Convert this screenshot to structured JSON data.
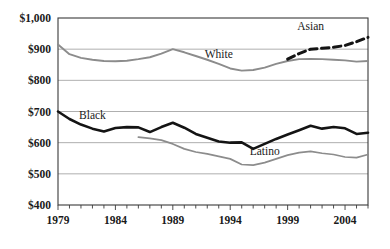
{
  "chart_data": {
    "type": "line",
    "title": "",
    "subtitle": "",
    "xlabel": "",
    "ylabel": "",
    "xlim": [
      1979,
      2006
    ],
    "ylim": [
      400,
      1000
    ],
    "ytick_labels": [
      "$1,000",
      "$900",
      "$800",
      "$700",
      "$600",
      "$500",
      "$400"
    ],
    "ytick_values": [
      1000,
      900,
      800,
      700,
      600,
      500,
      400
    ],
    "xtick_labels": [
      "1979",
      "1984",
      "1989",
      "1994",
      "1999",
      "2004"
    ],
    "xtick_values": [
      1979,
      1984,
      1989,
      1994,
      1999,
      2004
    ],
    "x_minor_tick_interval": 1,
    "grid": "horizontal",
    "legend": "inline-annotations",
    "annotations": [
      {
        "name": "white-label",
        "text": "White",
        "x": 1993.0,
        "y": 872
      },
      {
        "name": "asian-label",
        "text": "Asian",
        "x": 2001.0,
        "y": 962
      },
      {
        "name": "black-label",
        "text": "Black",
        "x": 1982.0,
        "y": 676
      },
      {
        "name": "latino-label",
        "text": "Latino",
        "x": 1997.0,
        "y": 560
      }
    ],
    "series": [
      {
        "name": "White",
        "style": "solid",
        "color": "#8c8c8c",
        "width": 1.9,
        "x": [
          1979,
          1980,
          1981,
          1982,
          1983,
          1984,
          1985,
          1986,
          1987,
          1988,
          1989,
          1990,
          1991,
          1992,
          1993,
          1994,
          1995,
          1996,
          1997,
          1998,
          1999,
          2000,
          2001,
          2002,
          2003,
          2004,
          2005,
          2006
        ],
        "values": [
          915,
          884,
          872,
          866,
          862,
          861,
          863,
          868,
          874,
          886,
          900,
          890,
          878,
          866,
          853,
          838,
          831,
          833,
          841,
          853,
          862,
          868,
          869,
          868,
          866,
          864,
          860,
          862
        ]
      },
      {
        "name": "Asian",
        "style": "dashed",
        "color": "#141414",
        "width": 3.0,
        "x": [
          1999,
          2000,
          2001,
          2002,
          2003,
          2004,
          2005,
          2006
        ],
        "values": [
          868,
          886,
          900,
          903,
          906,
          912,
          924,
          938
        ]
      },
      {
        "name": "Black",
        "style": "solid",
        "color": "#141414",
        "width": 2.6,
        "x": [
          1979,
          1980,
          1981,
          1982,
          1983,
          1984,
          1985,
          1986,
          1987,
          1988,
          1989,
          1990,
          1991,
          1992,
          1993,
          1994,
          1995,
          1996,
          1997,
          1998,
          1999,
          2000,
          2001,
          2002,
          2003,
          2004,
          2005,
          2006
        ],
        "values": [
          700,
          676,
          658,
          645,
          636,
          647,
          650,
          649,
          634,
          650,
          664,
          648,
          628,
          616,
          604,
          600,
          601,
          580,
          596,
          612,
          626,
          640,
          654,
          645,
          650,
          646,
          628,
          632
        ]
      },
      {
        "name": "Latino",
        "style": "solid",
        "color": "#8c8c8c",
        "width": 1.7,
        "x": [
          1986,
          1987,
          1988,
          1989,
          1990,
          1991,
          1992,
          1993,
          1994,
          1995,
          1996,
          1997,
          1998,
          1999,
          2000,
          2001,
          2002,
          2003,
          2004,
          2005,
          2006
        ],
        "values": [
          618,
          614,
          608,
          596,
          580,
          570,
          564,
          556,
          548,
          530,
          528,
          536,
          548,
          560,
          568,
          572,
          566,
          562,
          554,
          552,
          562
        ]
      }
    ]
  },
  "plot_geometry": {
    "left": 58,
    "top": 18,
    "right": 368,
    "bottom": 205
  }
}
